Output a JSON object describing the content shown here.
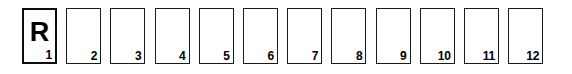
{
  "strip": {
    "name": "numbered-cell-strip",
    "background_color": "#ffffff",
    "border_color": "#1a1a1a",
    "text_color": "#000000",
    "cell_count": 12,
    "cells": [
      {
        "number": "1",
        "marker": "R",
        "emphasized": true
      },
      {
        "number": "2",
        "marker": "",
        "emphasized": false
      },
      {
        "number": "3",
        "marker": "",
        "emphasized": false
      },
      {
        "number": "4",
        "marker": "",
        "emphasized": false
      },
      {
        "number": "5",
        "marker": "",
        "emphasized": false
      },
      {
        "number": "6",
        "marker": "",
        "emphasized": false
      },
      {
        "number": "7",
        "marker": "",
        "emphasized": false
      },
      {
        "number": "8",
        "marker": "",
        "emphasized": false
      },
      {
        "number": "9",
        "marker": "",
        "emphasized": false
      },
      {
        "number": "10",
        "marker": "",
        "emphasized": false
      },
      {
        "number": "11",
        "marker": "",
        "emphasized": false
      },
      {
        "number": "12",
        "marker": "",
        "emphasized": false
      }
    ]
  }
}
